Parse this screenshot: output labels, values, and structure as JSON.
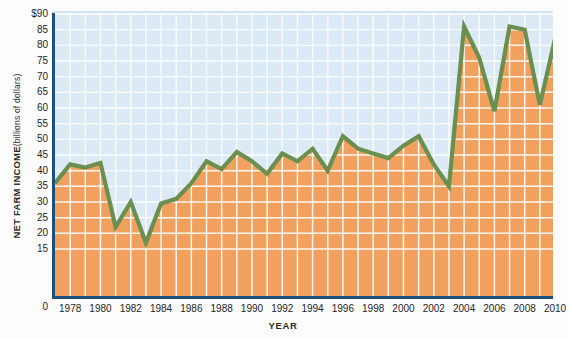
{
  "chart_data": {
    "type": "area",
    "title": "",
    "xlabel": "YEAR",
    "ylabel": "NET FARM INCOME (billions of dollars)",
    "ylabel_main": "NET FARM INCOME",
    "ylabel_sub": "(billions of dollars)",
    "ylim": [
      0,
      90
    ],
    "yticks": [
      "$90",
      "85",
      "80",
      "75",
      "70",
      "65",
      "60",
      "55",
      "50",
      "45",
      "40",
      "35",
      "30",
      "25",
      "20",
      "15"
    ],
    "ytick_values": [
      90,
      85,
      80,
      75,
      70,
      65,
      60,
      55,
      50,
      45,
      40,
      35,
      30,
      25,
      20,
      15
    ],
    "y_origin_label": "0",
    "xlim": [
      1977,
      2010
    ],
    "xticks": [
      "1978",
      "1980",
      "1982",
      "1984",
      "1986",
      "1988",
      "1990",
      "1992",
      "1994",
      "1996",
      "1998",
      "2000",
      "2002",
      "2004",
      "2006",
      "2008",
      "2010"
    ],
    "xtick_values": [
      1978,
      1980,
      1982,
      1984,
      1986,
      1988,
      1990,
      1992,
      1994,
      1996,
      1998,
      2000,
      2002,
      2004,
      2006,
      2008,
      2010
    ],
    "grid": true,
    "legend": "none",
    "x": [
      1977,
      1978,
      1979,
      1980,
      1981,
      1982,
      1983,
      1984,
      1985,
      1986,
      1987,
      1988,
      1989,
      1990,
      1991,
      1992,
      1993,
      1994,
      1995,
      1996,
      1997,
      1998,
      1999,
      2000,
      2001,
      2002,
      2003,
      2004,
      2005,
      2006,
      2007,
      2008,
      2009,
      2010
    ],
    "values": [
      36,
      42,
      41,
      42.5,
      22,
      30,
      17,
      29.5,
      31,
      36,
      43,
      40.5,
      46,
      43,
      39,
      45.5,
      43,
      47,
      40,
      51,
      47,
      45.5,
      44,
      48,
      51,
      42,
      35,
      86,
      76,
      59,
      86,
      85,
      61,
      82
    ],
    "series_name": "Net farm income",
    "colors": {
      "line": "#6b8f4e",
      "fill": "#f1a05e",
      "fill_grid": "#ffffff",
      "background": "#dbeaf6",
      "axis": "#1d4f80",
      "text": "#242424"
    }
  }
}
